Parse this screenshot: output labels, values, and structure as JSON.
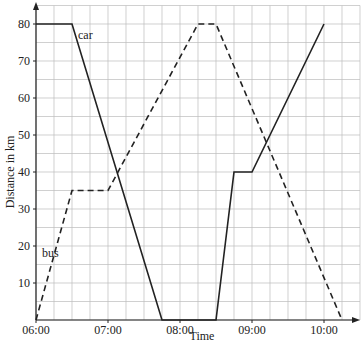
{
  "chart_data": {
    "type": "line",
    "title": "",
    "xlabel": "Time",
    "ylabel": "Distance in km",
    "x_ticks": [
      "06:00",
      "07:00",
      "08:00",
      "09:00",
      "10:00"
    ],
    "y_ticks": [
      10,
      20,
      30,
      40,
      50,
      60,
      70,
      80
    ],
    "xlim": [
      "06:00",
      "10:30"
    ],
    "ylim": [
      0,
      85
    ],
    "grid": true,
    "series": [
      {
        "name": "car",
        "style": "solid",
        "points": [
          [
            "06:00",
            80
          ],
          [
            "06:30",
            80
          ],
          [
            "07:45",
            0
          ],
          [
            "08:30",
            0
          ],
          [
            "08:45",
            40
          ],
          [
            "09:00",
            40
          ],
          [
            "10:00",
            80
          ]
        ]
      },
      {
        "name": "bus",
        "style": "dashed",
        "points": [
          [
            "06:00",
            0
          ],
          [
            "06:30",
            35
          ],
          [
            "07:00",
            35
          ],
          [
            "08:15",
            80
          ],
          [
            "08:30",
            80
          ],
          [
            "10:15",
            0
          ]
        ]
      }
    ],
    "annotations": [
      {
        "text": "car",
        "near": [
          "06:35",
          76
        ]
      },
      {
        "text": "bus",
        "near": [
          "06:05",
          17
        ]
      }
    ]
  }
}
